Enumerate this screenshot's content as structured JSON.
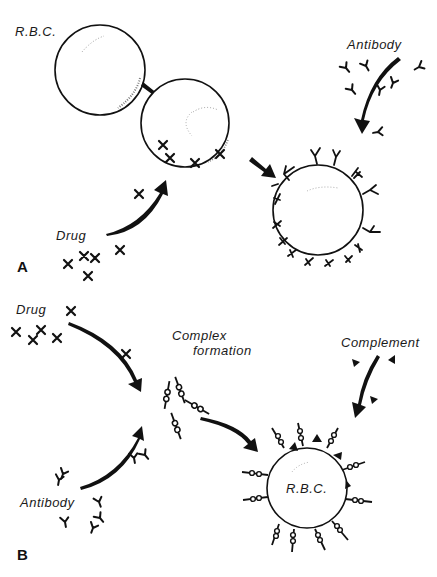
{
  "panel_a": {
    "letter": "A",
    "labels": {
      "rbc": "R.B.C.",
      "antibody": "Antibody",
      "drug": "Drug"
    }
  },
  "panel_b": {
    "letter": "B",
    "labels": {
      "drug": "Drug",
      "complex_line1": "Complex",
      "complex_line2": "formation",
      "complement": "Complement",
      "antibody": "Antibody",
      "rbc": "R.B.C."
    }
  },
  "colors": {
    "ink": "#111111",
    "background": "#ffffff"
  }
}
